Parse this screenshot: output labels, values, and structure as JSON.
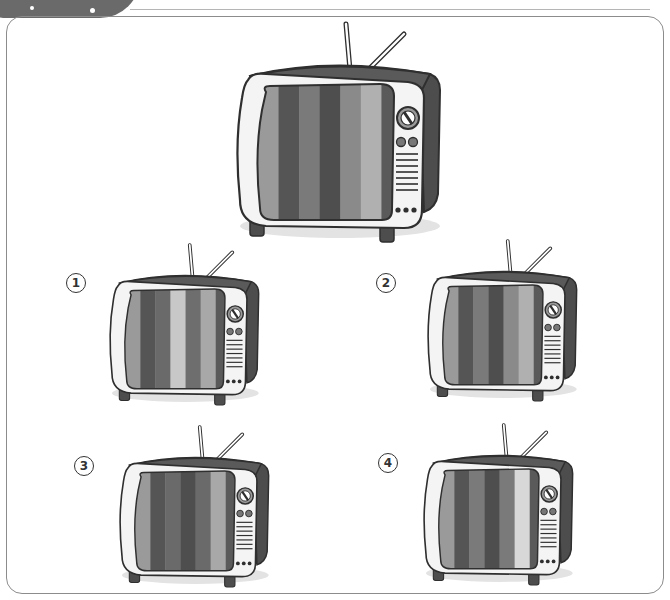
{
  "colors": {
    "body_dark": "#5a5a5a",
    "body_side": "#4d4d4d",
    "bezel": "#f4f4f4",
    "outline": "#2f2f2f",
    "shadow": "#e3e3e3",
    "frame_border": "#8c8c8c"
  },
  "reference_tv": {
    "stripes": [
      "#9a9a9a",
      "#555555",
      "#7a7a7a",
      "#4e4e4e",
      "#8a8a8a",
      "#b0b0b0",
      "#5a5a5a"
    ]
  },
  "options": [
    {
      "label": "1",
      "stripes": [
        "#9a9a9a",
        "#555555",
        "#6a6a6a",
        "#c8c8c8",
        "#6e6e6e",
        "#a8a8a8",
        "#5a5a5a"
      ]
    },
    {
      "label": "2",
      "stripes": [
        "#9a9a9a",
        "#555555",
        "#7a7a7a",
        "#4e4e4e",
        "#8a8a8a",
        "#b0b0b0",
        "#5a5a5a"
      ]
    },
    {
      "label": "3",
      "stripes": [
        "#9a9a9a",
        "#555555",
        "#6a6a6a",
        "#4e4e4e",
        "#6a6a6a",
        "#a8a8a8",
        "#5a5a5a"
      ]
    },
    {
      "label": "4",
      "stripes": [
        "#9a9a9a",
        "#555555",
        "#7a7a7a",
        "#4e4e4e",
        "#7a7a7a",
        "#d8d8d8",
        "#5a5a5a"
      ]
    }
  ]
}
